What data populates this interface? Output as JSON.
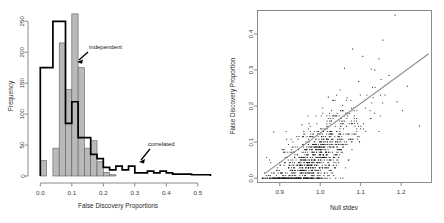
{
  "figure": {
    "background": "#ffffff",
    "panel_count": 2
  },
  "chart_data": [
    {
      "type": "bar",
      "id": "fdp-histogram",
      "title": "",
      "xlabel": "False Discovery Proportions",
      "ylabel": "Frequency",
      "xlim": [
        -0.02,
        0.545
      ],
      "ylim": [
        0,
        265
      ],
      "xticks": [
        0.0,
        0.1,
        0.2,
        0.3,
        0.4,
        0.5
      ],
      "xticklabels": [
        "0.0",
        "0.1",
        "0.2",
        "0.3",
        "0.4",
        "0.5"
      ],
      "yticks": [
        0,
        50,
        100,
        150,
        200,
        250
      ],
      "yticklabels": [
        "0",
        "50",
        "100",
        "150",
        "200",
        "250"
      ],
      "grid": false,
      "legend_position": "inline-annotations",
      "bin_width": 0.02,
      "series": [
        {
          "name": "independent",
          "style": "filled-grey-bars",
          "color": "#b9b9b9",
          "bin_left": [
            0.0,
            0.02,
            0.04,
            0.06,
            0.08,
            0.1,
            0.12,
            0.14,
            0.16,
            0.18,
            0.2,
            0.22,
            0.24,
            0.26,
            0.28,
            0.3,
            0.32,
            0.34,
            0.36,
            0.38,
            0.4,
            0.42,
            0.44,
            0.46,
            0.48,
            0.5,
            0.52
          ],
          "values": [
            25,
            0,
            45,
            215,
            140,
            262,
            175,
            45,
            57,
            23,
            6,
            2,
            0,
            0,
            0,
            0,
            0,
            0,
            0,
            0,
            0,
            0,
            0,
            0,
            0,
            0,
            0
          ]
        },
        {
          "name": "correlated",
          "style": "black-outline-steps",
          "color": "#000000",
          "bin_left": [
            0.0,
            0.02,
            0.04,
            0.06,
            0.08,
            0.1,
            0.12,
            0.14,
            0.16,
            0.18,
            0.2,
            0.22,
            0.24,
            0.26,
            0.28,
            0.3,
            0.32,
            0.34,
            0.36,
            0.38,
            0.4,
            0.42,
            0.44,
            0.46,
            0.48,
            0.5,
            0.52
          ],
          "values": [
            175,
            175,
            250,
            250,
            85,
            120,
            62,
            62,
            35,
            28,
            14,
            10,
            16,
            10,
            16,
            5,
            5,
            8,
            5,
            8,
            5,
            3,
            3,
            3,
            2,
            2,
            2
          ]
        }
      ],
      "annotations": [
        {
          "text": "independent",
          "x": 0.148,
          "y": 198,
          "arrow_to_x": 0.105,
          "arrow_to_y": 176
        },
        {
          "text": "correlated",
          "x": 0.318,
          "y": 42,
          "arrow_to_x": 0.282,
          "arrow_to_y": 17
        }
      ]
    },
    {
      "type": "scatter",
      "id": "fdp-vs-null-stdev",
      "title": "",
      "xlabel": "Null stdev",
      "ylabel": "False Discovery Proportion",
      "xlim": [
        0.845,
        1.275
      ],
      "ylim": [
        -0.012,
        0.465
      ],
      "xticks": [
        0.9,
        1.0,
        1.1,
        1.2
      ],
      "xticklabels": [
        "0.9",
        "1.0",
        "1.1",
        "1.2"
      ],
      "yticks": [
        0.0,
        0.1,
        0.2,
        0.3,
        0.4
      ],
      "yticklabels": [
        "0.0",
        "0.1",
        "0.2",
        "0.3",
        "0.4"
      ],
      "grid": false,
      "box_frame": true,
      "marker": "dot",
      "marker_color": "#1c1c1c",
      "point_count_approx": 1000,
      "trend_line": {
        "type": "linear-fit",
        "color": "#8c8c8c",
        "x_start": 0.862,
        "y_start": 0.012,
        "x_end": 1.268,
        "y_end": 0.345
      },
      "notes": "Points show horizontal banding at discrete FDP values; dense cloud at low FDP, positive association with null stdev."
    }
  ]
}
